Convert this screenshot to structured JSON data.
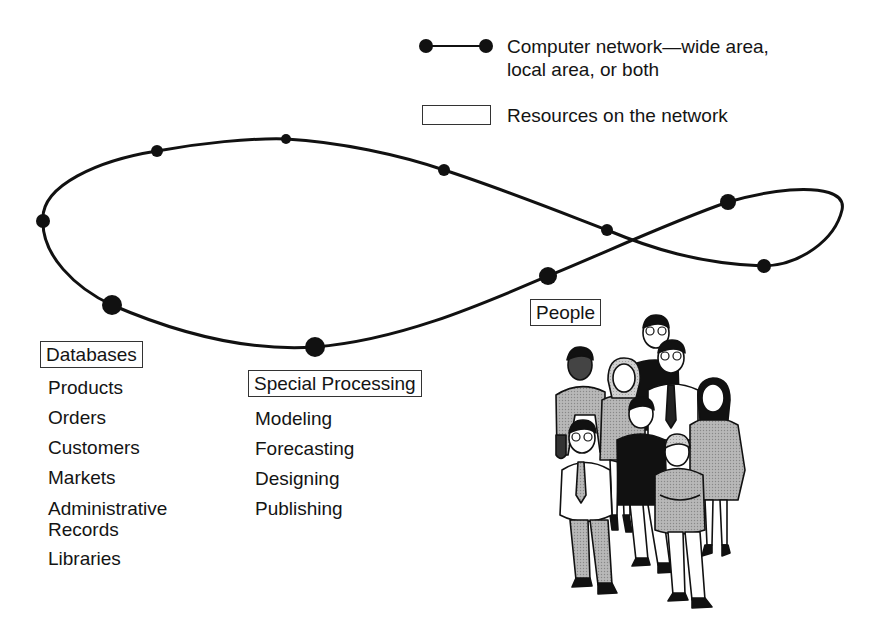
{
  "legend": {
    "network_label_line1": "Computer network—wide area,",
    "network_label_line2": "local area, or both",
    "resources_label": "Resources on the network",
    "network_icon": "line-with-end-nodes-icon",
    "resources_icon": "empty-rectangle-icon"
  },
  "network": {
    "shape": "figure-eight loop",
    "nodes": [
      {
        "x": 157,
        "y": 151,
        "r": 6
      },
      {
        "x": 286,
        "y": 139,
        "r": 5
      },
      {
        "x": 444,
        "y": 170,
        "r": 6
      },
      {
        "x": 607,
        "y": 230,
        "r": 6
      },
      {
        "x": 728,
        "y": 202,
        "r": 8
      },
      {
        "x": 764,
        "y": 266,
        "r": 7
      },
      {
        "x": 548,
        "y": 276,
        "r": 9
      },
      {
        "x": 315,
        "y": 347,
        "r": 10
      },
      {
        "x": 112,
        "y": 305,
        "r": 10
      },
      {
        "x": 43,
        "y": 221,
        "r": 7
      }
    ],
    "stroke_color": "#111111"
  },
  "databases": {
    "title": "Databases",
    "items": [
      "Products",
      "Orders",
      "Customers",
      "Markets",
      "Administrative Records",
      "Libraries"
    ],
    "items_split": {
      "products": "Products",
      "orders": "Orders",
      "customers": "Customers",
      "markets": "Markets",
      "admin_line1": "Administrative",
      "admin_line2": "Records",
      "libraries": "Libraries"
    }
  },
  "special_processing": {
    "title": "Special Processing",
    "items": [
      "Modeling",
      "Forecasting",
      "Designing",
      "Publishing"
    ]
  },
  "people": {
    "title": "People",
    "illustration": "group-of-eight-people-illustration"
  }
}
